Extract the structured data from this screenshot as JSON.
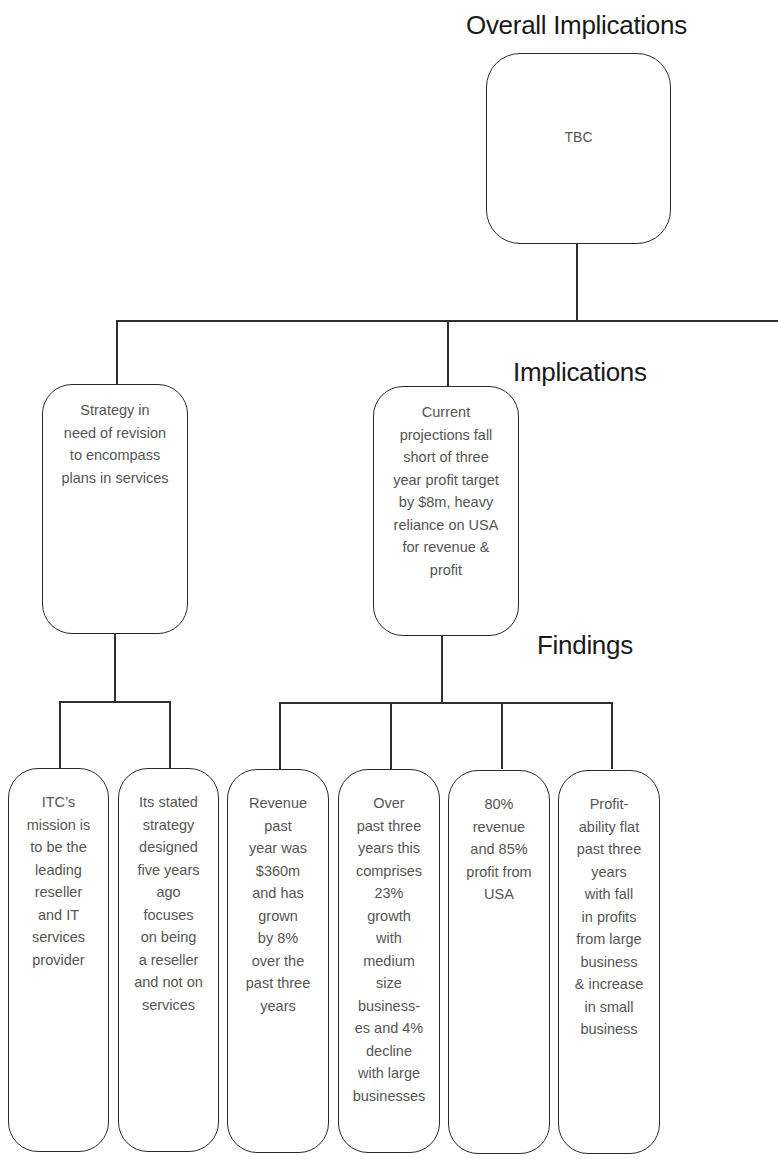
{
  "diagram": {
    "line_color": "#2e2e2e",
    "box_border_color": "#2a2a2a",
    "text_color": "#555555",
    "levels": {
      "overall": {
        "heading": "Overall Implications",
        "box": {
          "lines": [
            "TBC"
          ]
        }
      },
      "implications": {
        "heading": "Implications",
        "boxes": [
          {
            "lines": [
              "Strategy in",
              "need of revision",
              "to encompass",
              "plans in services"
            ]
          },
          {
            "lines": [
              "Current",
              "projections fall",
              "short of three",
              "year profit target",
              "by $8m, heavy",
              "reliance on USA",
              "for revenue &",
              "profit"
            ]
          }
        ]
      },
      "findings": {
        "heading": "Findings",
        "boxes": [
          {
            "lines": [
              "ITC’s",
              "mission is",
              "to be the",
              "leading",
              "reseller",
              "and IT",
              "services",
              "provider"
            ]
          },
          {
            "lines": [
              "Its stated",
              "strategy",
              "designed",
              "five years",
              "ago",
              "focuses",
              "on being",
              "a reseller",
              "and not on",
              "services"
            ]
          },
          {
            "lines": [
              "Revenue",
              "past",
              "year was",
              "$360m",
              "and has",
              "grown",
              "by 8%",
              "over the",
              "past three",
              "years"
            ]
          },
          {
            "lines": [
              "Over",
              "past three",
              "years this",
              "comprises",
              "23%",
              "growth",
              "with",
              "medium",
              "size",
              "business-",
              "es and 4%",
              "decline",
              "with large",
              "businesses"
            ]
          },
          {
            "lines": [
              "80%",
              "revenue",
              "and 85%",
              "profit from",
              "USA"
            ]
          },
          {
            "lines": [
              "Profit-",
              "ability flat",
              "past three",
              "years",
              "with fall",
              "in profits",
              "from large",
              "business",
              "& increase",
              "in small",
              "business"
            ]
          }
        ]
      }
    }
  }
}
